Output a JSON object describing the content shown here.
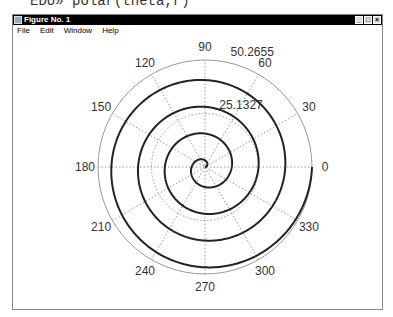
{
  "command": "EDU» polar(theta,r)",
  "window": {
    "title": "Figure No. 1",
    "buttons": [
      "_",
      "□",
      "×"
    ]
  },
  "menu": [
    "File",
    "Edit",
    "Window",
    "Help"
  ],
  "chart_data": {
    "type": "polar-line",
    "title": "",
    "function": "r = 2*theta",
    "theta_range": [
      0,
      25.1327
    ],
    "r_max": 50.2655,
    "radial_ticks": [
      "25.1327",
      "50.2655"
    ],
    "angle_ticks": [
      "0",
      "30",
      "60",
      "90",
      "120",
      "150",
      "180",
      "210",
      "240",
      "270",
      "300",
      "330"
    ],
    "grid": true,
    "series": [
      {
        "name": "spiral",
        "color": "#222222",
        "points": "Archimedean spiral, 4 turns"
      }
    ]
  }
}
